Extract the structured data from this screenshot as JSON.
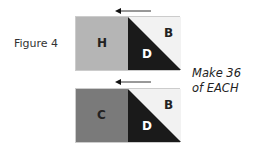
{
  "figure_label": "Figure 4",
  "instruction": {
    "line1": "Make 36",
    "line2": "of EACH"
  },
  "blocks": [
    {
      "left_letter": "H",
      "left_color": "#b5b5b5",
      "top_right_letter": "B",
      "bottom_letter": "D",
      "light_color": "#f2f2f2",
      "dark_color": "#1a1a1a"
    },
    {
      "left_letter": "C",
      "left_color": "#7a7a7a",
      "top_right_letter": "B",
      "bottom_letter": "D",
      "light_color": "#f2f2f2",
      "dark_color": "#1a1a1a"
    }
  ],
  "arrows": [
    {
      "direction": "left"
    },
    {
      "direction": "left"
    }
  ]
}
